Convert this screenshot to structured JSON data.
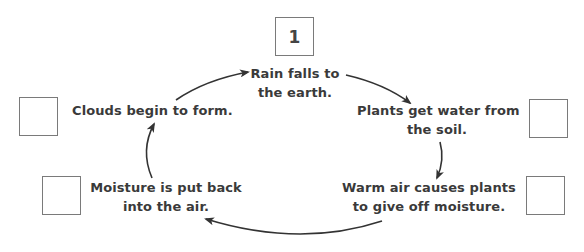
{
  "diagram": {
    "type": "cycle",
    "title": "",
    "arrow_color": "#333333",
    "box_border_color": "#7a7a7a",
    "steps": [
      {
        "id": "rain",
        "box_value": "1",
        "lines": [
          "Rain falls to",
          "the earth."
        ]
      },
      {
        "id": "plants-water",
        "box_value": "",
        "lines": [
          "Plants get water from",
          "the soil."
        ]
      },
      {
        "id": "warm-air",
        "box_value": "",
        "lines": [
          "Warm air causes plants",
          "to give off moisture."
        ]
      },
      {
        "id": "moisture",
        "box_value": "",
        "lines": [
          "Moisture is put back",
          "into the air."
        ]
      },
      {
        "id": "clouds",
        "box_value": "",
        "lines": [
          "Clouds begin to form."
        ]
      }
    ],
    "cycle_order": [
      "rain",
      "plants-water",
      "warm-air",
      "moisture",
      "clouds",
      "rain"
    ]
  }
}
